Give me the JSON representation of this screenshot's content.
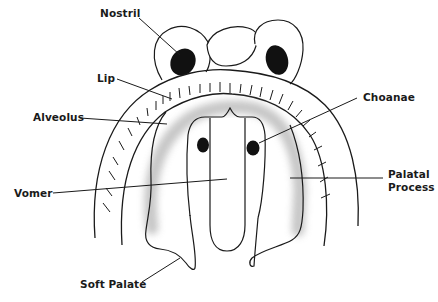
{
  "diagram": {
    "colors": {
      "line": "#1a1a1a",
      "fill": "#ffffff",
      "shading": "#bdbdbd",
      "dark": "#111111"
    },
    "labels": {
      "nostril": "Nostril",
      "lip": "Lip",
      "alveolus": "Alveolus",
      "choanae": "Choanae",
      "vomer": "Vomer",
      "palatal_process_line1": "Palatal",
      "palatal_process_line2": "Process",
      "soft_palate": "Soft Palate"
    }
  }
}
